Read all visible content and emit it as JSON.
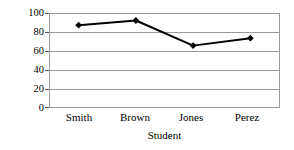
{
  "chart_data": {
    "type": "line",
    "title": "",
    "xlabel": "Student",
    "ylabel": "Score",
    "categories": [
      "Smith",
      "Brown",
      "Jones",
      "Perez"
    ],
    "values": [
      88,
      93,
      66,
      74
    ],
    "series": [
      {
        "name": "Score",
        "values": [
          88,
          93,
          66,
          74
        ]
      }
    ],
    "ylim": [
      0,
      100
    ],
    "yticks": [
      0,
      20,
      40,
      60,
      80,
      100
    ],
    "ytick_labels": [
      "0",
      "20",
      "40",
      "60",
      "80",
      "100"
    ],
    "grid": "horizontal",
    "legend": "none",
    "marker": "diamond",
    "line_color": "#000000",
    "marker_color": "#000000",
    "grid_color": "#9a9a9a",
    "background_color": "#ffffff"
  }
}
